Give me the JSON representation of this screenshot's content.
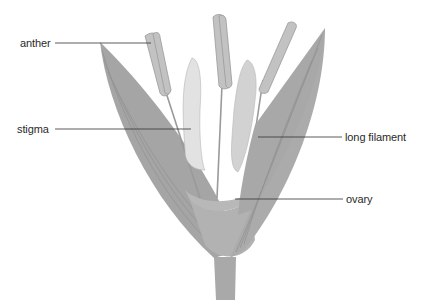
{
  "diagram": {
    "colors": {
      "petal_fill": "#a9a9a9",
      "petal_vein": "#8f8f8f",
      "stamen_fill": "#c2c2c2",
      "stamen_stroke": "#9a9a9a",
      "stigma_fill": "#d6d6d6",
      "leader_line": "#333333",
      "text": "#2a2a2a"
    },
    "labels": [
      {
        "id": "anther",
        "text": "anther",
        "x": 20,
        "y": 40
      },
      {
        "id": "stigma",
        "text": "stigma",
        "x": 17,
        "y": 126
      },
      {
        "id": "long-filament",
        "text": "long filament",
        "x": 345,
        "y": 133
      },
      {
        "id": "ovary",
        "text": "ovary",
        "x": 346,
        "y": 196
      }
    ]
  }
}
